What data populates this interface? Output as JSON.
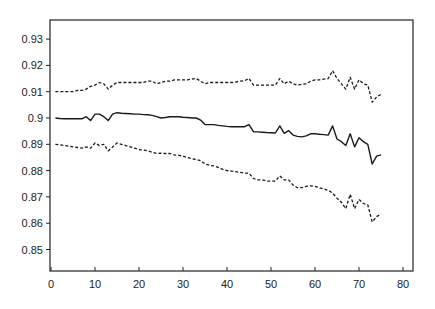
{
  "chart_data": {
    "type": "line",
    "title": "",
    "xlabel": "",
    "ylabel": "",
    "xlim": [
      0,
      82
    ],
    "ylim": [
      0.84,
      0.937
    ],
    "grid": false,
    "legend": null,
    "x_ticks": [
      0,
      10,
      20,
      30,
      40,
      50,
      60,
      70,
      80
    ],
    "x_tick_labels": [
      "0",
      "10",
      "20",
      "30",
      "40",
      "50",
      "60",
      "70",
      "80"
    ],
    "y_ticks": [
      0.85,
      0.86,
      0.87,
      0.88,
      0.89,
      0.9,
      0.91,
      0.92,
      0.93
    ],
    "y_tick_labels": [
      "0.85",
      "0.86",
      "0.87",
      "0.88",
      "0.89",
      "0.9",
      "0.91",
      "0.92",
      "0.93"
    ],
    "x": [
      1,
      2,
      3,
      4,
      5,
      6,
      7,
      8,
      9,
      10,
      11,
      12,
      13,
      14,
      15,
      16,
      17,
      18,
      19,
      20,
      21,
      22,
      23,
      24,
      25,
      26,
      27,
      28,
      29,
      30,
      31,
      32,
      33,
      34,
      35,
      36,
      37,
      38,
      39,
      40,
      41,
      42,
      43,
      44,
      45,
      46,
      47,
      48,
      49,
      50,
      51,
      52,
      53,
      54,
      55,
      56,
      57,
      58,
      59,
      60,
      61,
      62,
      63,
      64,
      65,
      66,
      67,
      68,
      69,
      70,
      71,
      72,
      73,
      74,
      75
    ],
    "series": [
      {
        "name": "upper",
        "style": "dashed",
        "values": [
          0.91,
          0.91,
          0.91,
          0.91,
          0.91,
          0.9105,
          0.9105,
          0.911,
          0.912,
          0.9125,
          0.9135,
          0.913,
          0.911,
          0.9125,
          0.9135,
          0.9135,
          0.9135,
          0.9135,
          0.9135,
          0.9135,
          0.9135,
          0.914,
          0.914,
          0.913,
          0.9135,
          0.914,
          0.914,
          0.9145,
          0.9145,
          0.9145,
          0.9145,
          0.9148,
          0.915,
          0.914,
          0.913,
          0.9135,
          0.9135,
          0.9135,
          0.9135,
          0.9135,
          0.9135,
          0.9137,
          0.914,
          0.9142,
          0.915,
          0.9125,
          0.9125,
          0.9125,
          0.9125,
          0.9125,
          0.9125,
          0.915,
          0.913,
          0.914,
          0.913,
          0.9125,
          0.9128,
          0.913,
          0.914,
          0.9145,
          0.9145,
          0.9148,
          0.915,
          0.918,
          0.915,
          0.913,
          0.911,
          0.9155,
          0.911,
          0.9145,
          0.913,
          0.9125,
          0.906,
          0.908,
          0.909
        ]
      },
      {
        "name": "center",
        "style": "solid",
        "values": [
          0.9,
          0.8998,
          0.8997,
          0.8997,
          0.8997,
          0.8997,
          0.8997,
          0.9005,
          0.899,
          0.9015,
          0.9015,
          0.9005,
          0.899,
          0.9015,
          0.902,
          0.9018,
          0.9017,
          0.9016,
          0.9015,
          0.9015,
          0.9013,
          0.9012,
          0.901,
          0.9005,
          0.9,
          0.9002,
          0.9005,
          0.9005,
          0.9005,
          0.9003,
          0.9002,
          0.9,
          0.9,
          0.8992,
          0.8975,
          0.8975,
          0.8975,
          0.8972,
          0.897,
          0.8968,
          0.8967,
          0.8967,
          0.8967,
          0.8967,
          0.8975,
          0.8948,
          0.8947,
          0.8946,
          0.8945,
          0.8944,
          0.8943,
          0.897,
          0.8942,
          0.8952,
          0.8935,
          0.893,
          0.8928,
          0.8932,
          0.894,
          0.894,
          0.8938,
          0.8937,
          0.8935,
          0.897,
          0.892,
          0.891,
          0.8895,
          0.894,
          0.889,
          0.8925,
          0.891,
          0.89,
          0.8825,
          0.8855,
          0.886
        ]
      },
      {
        "name": "lower",
        "style": "dashed",
        "values": [
          0.89,
          0.8898,
          0.8895,
          0.8893,
          0.889,
          0.8888,
          0.8885,
          0.889,
          0.8885,
          0.8905,
          0.8895,
          0.89,
          0.8875,
          0.889,
          0.8905,
          0.89,
          0.8895,
          0.889,
          0.8885,
          0.888,
          0.8878,
          0.8875,
          0.887,
          0.8865,
          0.8866,
          0.8865,
          0.8865,
          0.886,
          0.8858,
          0.8855,
          0.885,
          0.8845,
          0.8842,
          0.8838,
          0.8825,
          0.882,
          0.8818,
          0.8812,
          0.8805,
          0.88,
          0.8798,
          0.8796,
          0.8793,
          0.879,
          0.879,
          0.877,
          0.8765,
          0.8765,
          0.876,
          0.876,
          0.876,
          0.878,
          0.8765,
          0.8765,
          0.8745,
          0.8735,
          0.8735,
          0.874,
          0.8742,
          0.874,
          0.8735,
          0.873,
          0.8725,
          0.8715,
          0.8695,
          0.868,
          0.8655,
          0.871,
          0.8655,
          0.869,
          0.8675,
          0.867,
          0.8605,
          0.8625,
          0.8635
        ]
      }
    ]
  }
}
